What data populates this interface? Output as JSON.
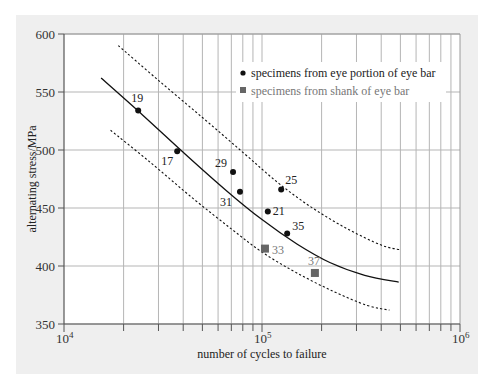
{
  "chart_data": {
    "type": "scatter",
    "title": "",
    "xlabel": "number of cycles to failure",
    "ylabel": "alternating stress/MPa",
    "xscale": "log",
    "xlim": [
      10000,
      1000000
    ],
    "ylim": [
      350,
      600
    ],
    "x_tick_labels": [
      {
        "base": "10",
        "exp": "4",
        "value": 10000
      },
      {
        "base": "10",
        "exp": "5",
        "value": 100000
      },
      {
        "base": "10",
        "exp": "6",
        "value": 1000000
      }
    ],
    "y_ticks": [
      350,
      400,
      450,
      500,
      550,
      600
    ],
    "grid": true,
    "legend": {
      "position": "upper right",
      "entries": [
        {
          "label": "specimens from eye portion of eye bar",
          "marker": "circle",
          "color": "#111111"
        },
        {
          "label": "specimens from shank of eye bar",
          "marker": "square",
          "color": "#666666"
        }
      ]
    },
    "series": [
      {
        "name": "specimens from eye portion of eye bar",
        "marker": "circle",
        "color": "#111111",
        "points": [
          {
            "id": "19",
            "x": 23700,
            "y": 534
          },
          {
            "id": "17",
            "x": 37300,
            "y": 499
          },
          {
            "id": "29",
            "x": 71400,
            "y": 481
          },
          {
            "id": "31",
            "x": 77400,
            "y": 464
          },
          {
            "id": "21",
            "x": 107000,
            "y": 447
          },
          {
            "id": "25",
            "x": 125000,
            "y": 466
          },
          {
            "id": "35",
            "x": 134000,
            "y": 428
          }
        ]
      },
      {
        "name": "specimens from shank of eye bar",
        "marker": "square",
        "color": "#666666",
        "points": [
          {
            "id": "33",
            "x": 103500,
            "y": 415
          },
          {
            "id": "37",
            "x": 185000,
            "y": 394
          }
        ]
      },
      {
        "name": "mean S-N curve",
        "style": "solid",
        "color": "#111111",
        "points": [
          {
            "x": 15400,
            "y": 562
          },
          {
            "x": 25000,
            "y": 530
          },
          {
            "x": 40000,
            "y": 498
          },
          {
            "x": 65000,
            "y": 466
          },
          {
            "x": 100000,
            "y": 440
          },
          {
            "x": 150000,
            "y": 419
          },
          {
            "x": 220000,
            "y": 403
          },
          {
            "x": 330000,
            "y": 392
          },
          {
            "x": 490000,
            "y": 386
          }
        ]
      },
      {
        "name": "upper scatter band",
        "style": "dashed",
        "color": "#111111",
        "points": [
          {
            "x": 18800,
            "y": 590
          },
          {
            "x": 30000,
            "y": 560
          },
          {
            "x": 50000,
            "y": 528
          },
          {
            "x": 80000,
            "y": 498
          },
          {
            "x": 120000,
            "y": 472
          },
          {
            "x": 180000,
            "y": 450
          },
          {
            "x": 270000,
            "y": 432
          },
          {
            "x": 400000,
            "y": 418
          },
          {
            "x": 500000,
            "y": 414
          }
        ]
      },
      {
        "name": "lower scatter band",
        "style": "dashed",
        "color": "#111111",
        "points": [
          {
            "x": 17200,
            "y": 517
          },
          {
            "x": 27000,
            "y": 490
          },
          {
            "x": 45000,
            "y": 458
          },
          {
            "x": 70000,
            "y": 432
          },
          {
            "x": 100000,
            "y": 412
          },
          {
            "x": 150000,
            "y": 394
          },
          {
            "x": 230000,
            "y": 378
          },
          {
            "x": 340000,
            "y": 366
          },
          {
            "x": 440000,
            "y": 362
          }
        ]
      }
    ]
  }
}
